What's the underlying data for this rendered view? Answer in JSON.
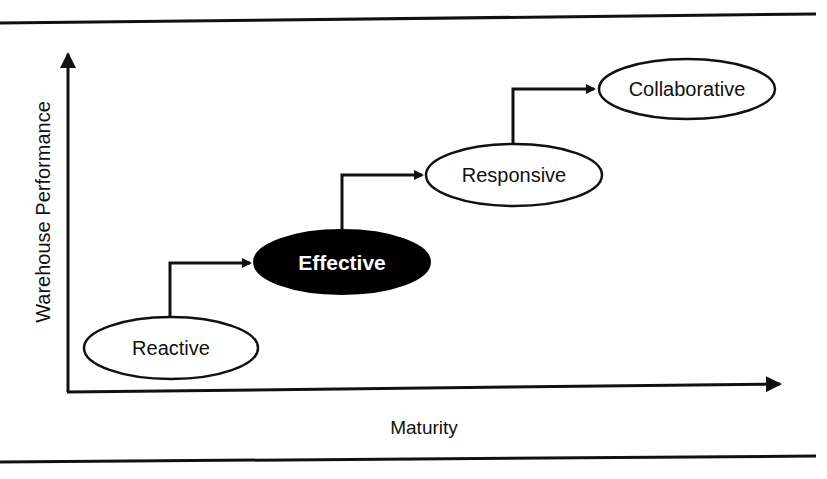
{
  "diagram": {
    "y_axis_label": "Warehouse Performance",
    "x_axis_label": "Maturity",
    "stages": [
      {
        "label": "Reactive",
        "highlighted": false
      },
      {
        "label": "Effective",
        "highlighted": true
      },
      {
        "label": "Responsive",
        "highlighted": false
      },
      {
        "label": "Collaborative",
        "highlighted": false
      }
    ]
  },
  "colors": {
    "line": "#111111",
    "highlight_fill": "#000000",
    "highlight_text": "#ffffff",
    "node_fill": "#ffffff"
  }
}
